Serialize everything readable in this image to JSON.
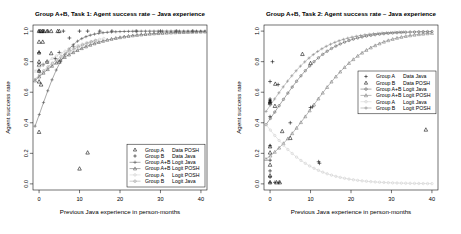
{
  "figure": {
    "width": 461,
    "height": 234,
    "background": "#ffffff"
  },
  "chart_data": [
    {
      "id": "task1",
      "type": "scatter",
      "title": "Group A+B, Task 1: Agent success rate ~ Java experience",
      "xlabel": "Previous Java experience in person-months",
      "ylabel": "Agent success rate",
      "xlim": [
        -1.5,
        41.5
      ],
      "ylim": [
        -0.04,
        1.04
      ],
      "xticks": [
        0,
        10,
        20,
        30,
        40
      ],
      "yticks": [
        0.0,
        0.2,
        0.4,
        0.6,
        0.8,
        1.0
      ],
      "yticklabels": [
        "0.0",
        "0.2",
        "0.4",
        "0.6",
        "0.8",
        "1.0"
      ],
      "grid": false,
      "legend_position": "bottom-right",
      "legend": [
        {
          "group": "Group A",
          "series": "Data POSH",
          "marker": "triangle",
          "line": false,
          "color": "#000000"
        },
        {
          "group": "Group B",
          "series": "Data Java",
          "marker": "plus",
          "line": false,
          "color": "#000000"
        },
        {
          "group": "Group A+B",
          "series": "Logit Java",
          "marker": "plus",
          "line": true,
          "color": "#555555"
        },
        {
          "group": "Group A+B",
          "series": "Logit POSH",
          "marker": "triangle",
          "line": true,
          "color": "#555555"
        },
        {
          "group": "Group A",
          "series": "Logit POSH",
          "marker": "circle",
          "line": true,
          "color": "#cccccc"
        },
        {
          "group": "Group B",
          "series": "Logit Java",
          "marker": "circle",
          "line": true,
          "color": "#999999"
        }
      ],
      "series": [
        {
          "name": "Group A Data POSH",
          "marker": "triangle",
          "color": "#000000",
          "points": [
            [
              0,
              1.0
            ],
            [
              0.4,
              1.0
            ],
            [
              0.8,
              1.0
            ],
            [
              1.2,
              1.0
            ],
            [
              2.0,
              1.0
            ],
            [
              3.0,
              1.0
            ],
            [
              4.6,
              1.0
            ],
            [
              5.0,
              1.0
            ],
            [
              0,
              0.93
            ],
            [
              0.9,
              0.93
            ],
            [
              0,
              0.86
            ],
            [
              0,
              0.8
            ],
            [
              0,
              0.78
            ],
            [
              0,
              0.74
            ],
            [
              0,
              0.67
            ],
            [
              0.5,
              0.65
            ],
            [
              0,
              0.34
            ],
            [
              10,
              0.1
            ],
            [
              12,
              0.205
            ],
            [
              2.0,
              0.8
            ],
            [
              3.0,
              0.855
            ],
            [
              5.0,
              0.8
            ]
          ]
        },
        {
          "name": "Group B Data Java",
          "marker": "plus",
          "color": "#000000",
          "points": [
            [
              0,
              1.0
            ],
            [
              1.0,
              1.0
            ],
            [
              2.2,
              1.0
            ],
            [
              6.0,
              1.0
            ],
            [
              10.0,
              1.0
            ],
            [
              12.0,
              1.0
            ],
            [
              15.0,
              1.0
            ],
            [
              18.0,
              1.0
            ],
            [
              24.0,
              1.0
            ],
            [
              30.0,
              1.0
            ],
            [
              34.0,
              1.0
            ],
            [
              38.0,
              1.0
            ],
            [
              7.5,
              0.955
            ],
            [
              8.5,
              0.9
            ],
            [
              5.0,
              0.86
            ],
            [
              4.0,
              0.82
            ],
            [
              2.0,
              0.8
            ],
            [
              1.0,
              0.78
            ],
            [
              0,
              0.74
            ],
            [
              0,
              0.86
            ]
          ]
        },
        {
          "name": "Group A+B Logit Java",
          "marker": "plus",
          "color": "#555555",
          "line": true,
          "curve": {
            "fn": "logit",
            "a": -0.2,
            "b": 0.3,
            "x0": -1.0,
            "x1": 41.0,
            "n": 40
          }
        },
        {
          "name": "Group A+B Logit POSH",
          "marker": "triangle",
          "color": "#555555",
          "line": true,
          "curve": {
            "fn": "logit",
            "a": 0.85,
            "b": 0.115,
            "x0": -1.0,
            "x1": 41.0,
            "n": 40
          }
        },
        {
          "name": "Group A Logit POSH",
          "marker": "circle",
          "color": "#cccccc",
          "line": true,
          "curve": {
            "fn": "logit",
            "a": 1.15,
            "b": 0.115,
            "x0": -1.0,
            "x1": 16.0,
            "n": 16
          }
        },
        {
          "name": "Group B Logit Java",
          "marker": "circle",
          "color": "#999999",
          "line": true,
          "curve": {
            "fn": "logit",
            "a": 0.9,
            "b": 0.13,
            "x0": -1.0,
            "x1": 14.0,
            "n": 14
          }
        }
      ]
    },
    {
      "id": "task2",
      "type": "scatter",
      "title": "Group A+B, Task 2: Agent success rate ~ Java experience",
      "xlabel": "Previous Java experience in person-months",
      "ylabel": "Agent success rate",
      "xlim": [
        -1.5,
        41.5
      ],
      "ylim": [
        -0.04,
        1.04
      ],
      "xticks": [
        0,
        10,
        20,
        30,
        40
      ],
      "yticks": [
        0.0,
        0.2,
        0.4,
        0.6,
        0.8,
        1.0
      ],
      "yticklabels": [
        "0.0",
        "0.2",
        "0.4",
        "0.6",
        "0.8",
        "1.0"
      ],
      "grid": false,
      "legend_position": "middle-right",
      "legend": [
        {
          "group": "Group A",
          "series": "Data Java",
          "marker": "plus",
          "line": false,
          "color": "#000000"
        },
        {
          "group": "Group B",
          "series": "Data POSH",
          "marker": "triangle",
          "line": false,
          "color": "#000000"
        },
        {
          "group": "Group A+B",
          "series": "Logit Java",
          "marker": "circle",
          "line": true,
          "color": "#555555"
        },
        {
          "group": "Group A+B",
          "series": "Logit POSH",
          "marker": "triangle",
          "line": true,
          "color": "#777777"
        },
        {
          "group": "Group A",
          "series": "Logit Java",
          "marker": "circle",
          "line": true,
          "color": "#cccccc"
        },
        {
          "group": "Group B",
          "series": "Logit POSH",
          "marker": "plus",
          "line": true,
          "color": "#888888"
        }
      ],
      "series": [
        {
          "name": "Group A Data Java",
          "marker": "plus",
          "color": "#000000",
          "points": [
            [
              0.6,
              0.8
            ],
            [
              0,
              0.67
            ],
            [
              2.0,
              0.65
            ],
            [
              0,
              0.555
            ],
            [
              0,
              0.545
            ],
            [
              0,
              0.535
            ],
            [
              0,
              0.525
            ],
            [
              0,
              0.44
            ],
            [
              5.0,
              0.4
            ],
            [
              0,
              0.25
            ],
            [
              0,
              0.155
            ],
            [
              0,
              0.085
            ],
            [
              0,
              0.045
            ],
            [
              0,
              0.01
            ],
            [
              1.2,
              0.01
            ],
            [
              2.2,
              0.01
            ],
            [
              10.0,
              0.5
            ],
            [
              10.5,
              0.505
            ],
            [
              12.0,
              0.145
            ],
            [
              12.2,
              0.135
            ]
          ]
        },
        {
          "name": "Group B Data POSH",
          "marker": "triangle",
          "color": "#000000",
          "points": [
            [
              8.0,
              0.85
            ],
            [
              10.0,
              0.79
            ],
            [
              1.3,
              0.655
            ],
            [
              1.2,
              0.51
            ],
            [
              5.0,
              0.3
            ],
            [
              3.0,
              0.345
            ],
            [
              0,
              0.245
            ],
            [
              0,
              0.205
            ],
            [
              0,
              0.125
            ],
            [
              0,
              0.055
            ],
            [
              0,
              0.01
            ],
            [
              1.6,
              0.01
            ],
            [
              2.4,
              0.01
            ],
            [
              38.5,
              0.355
            ],
            [
              0,
              0.54
            ],
            [
              0,
              0.53
            ]
          ]
        },
        {
          "name": "Group A+B Logit Java",
          "marker": "circle",
          "color": "#555555",
          "line": true,
          "curve": {
            "fn": "logit",
            "a": -0.3,
            "b": 0.155,
            "x0": -1.0,
            "x1": 40.0,
            "n": 38
          }
        },
        {
          "name": "Group A+B Logit POSH",
          "marker": "triangle",
          "color": "#777777",
          "line": true,
          "curve": {
            "fn": "logit",
            "a": -1.5,
            "b": 0.145,
            "x0": -1.0,
            "x1": 40.0,
            "n": 38
          }
        },
        {
          "name": "Group A Logit Java",
          "marker": "circle",
          "color": "#cccccc",
          "line": true,
          "curve": {
            "fn": "logit",
            "a": -0.6,
            "b": -0.145,
            "x0": -1.0,
            "x1": 40.0,
            "n": 38
          }
        },
        {
          "name": "Group B Logit POSH",
          "marker": "plus",
          "color": "#888888",
          "line": true,
          "curve": {
            "fn": "logit",
            "a": 0.05,
            "b": 0.155,
            "x0": -1.0,
            "x1": 33.0,
            "n": 32
          }
        }
      ]
    }
  ]
}
